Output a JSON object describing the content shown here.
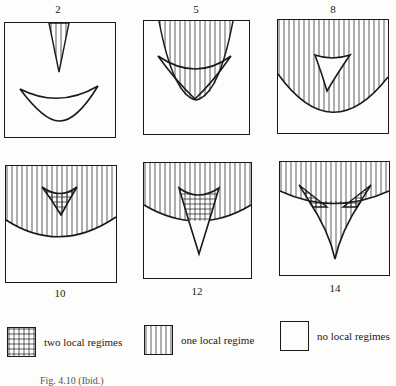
{
  "figure": {
    "panels": [
      {
        "id": "2",
        "label": "2",
        "label_position": "top"
      },
      {
        "id": "5",
        "label": "5",
        "label_position": "top"
      },
      {
        "id": "8",
        "label": "8",
        "label_position": "top"
      },
      {
        "id": "10",
        "label": "10",
        "label_position": "bottom"
      },
      {
        "id": "12",
        "label": "12",
        "label_position": "bottom"
      },
      {
        "id": "14",
        "label": "14",
        "label_position": "bottom"
      }
    ],
    "legend": [
      {
        "pattern": "grid",
        "label": "two local regimes"
      },
      {
        "pattern": "vertical-lines",
        "label": "one local regime"
      },
      {
        "pattern": "blank",
        "label": "no local regimes"
      }
    ],
    "caption": "Fig. 4.10 (Ibid.)"
  },
  "colors": {
    "ink": "#1a1a1a",
    "paper": "#fdfdfb"
  }
}
